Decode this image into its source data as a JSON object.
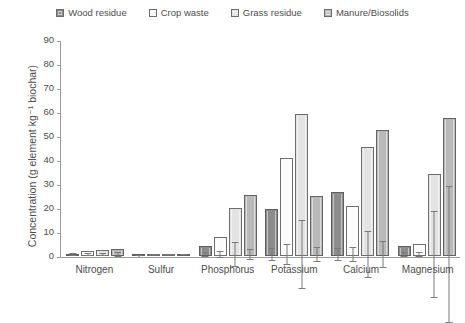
{
  "chart_data": {
    "type": "bar",
    "title": "",
    "xlabel": "",
    "ylabel": "Concentration (g element kg⁻¹ biochar)",
    "ylim": [
      0,
      90
    ],
    "yticks": [
      0,
      10,
      20,
      30,
      40,
      50,
      60,
      70,
      80,
      90
    ],
    "grid": false,
    "legend_position": "top-center",
    "categories": [
      "Nitrogen",
      "Sulfur",
      "Phosphorus",
      "Potassium",
      "Calcium",
      "Magnesium"
    ],
    "series": [
      {
        "name": "Wood residue",
        "color": "#8c8c8c",
        "values": [
          1.0,
          0.3,
          4.0,
          19.5,
          26.5,
          4.0
        ],
        "errors": [
          0.4,
          0.1,
          0.8,
          2.5,
          2.5,
          0.8
        ]
      },
      {
        "name": "Crop waste",
        "color": "#fbfbfb",
        "values": [
          2.0,
          0.4,
          8.0,
          41.0,
          21.0,
          5.0
        ],
        "errors": [
          0.5,
          0.1,
          1.2,
          4.0,
          3.0,
          1.0
        ]
      },
      {
        "name": "Grass residue",
        "color": "#e3e3e3",
        "values": [
          2.5,
          0.5,
          20.0,
          59.0,
          45.5,
          34.0
        ],
        "errors": [
          0.6,
          0.1,
          5.0,
          14.0,
          9.5,
          18.0
        ]
      },
      {
        "name": "Manure/Biosolids",
        "color": "#b9b9b9",
        "values": [
          3.0,
          0.8,
          25.5,
          25.0,
          52.5,
          57.5
        ],
        "errors": [
          0.7,
          0.2,
          2.0,
          3.0,
          5.5,
          28.5
        ]
      }
    ]
  },
  "legend": {
    "items": [
      {
        "label": "Wood residue"
      },
      {
        "label": "Crop waste"
      },
      {
        "label": "Grass residue"
      },
      {
        "label": "Manure/Biosolids"
      }
    ]
  }
}
